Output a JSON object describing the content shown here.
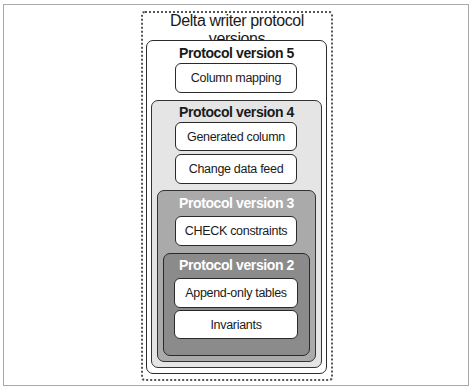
{
  "diagram": {
    "title": "Delta writer protocol versions",
    "versions": [
      {
        "label": "Protocol version 5",
        "features": [
          "Column mapping"
        ]
      },
      {
        "label": "Protocol version 4",
        "features": [
          "Generated column",
          "Change data feed"
        ]
      },
      {
        "label": "Protocol version 3",
        "features": [
          "CHECK constraints"
        ]
      },
      {
        "label": "Protocol version 2",
        "features": [
          "Append-only tables",
          "Invariants"
        ]
      }
    ],
    "colors": {
      "v5_fill": "#ffffff",
      "v4_fill": "#e5e5e5",
      "v3_fill": "#aaaaaa",
      "v2_fill": "#8b8b8b",
      "feature_fill": "#ffffff",
      "border": "#2a2a2a"
    }
  }
}
